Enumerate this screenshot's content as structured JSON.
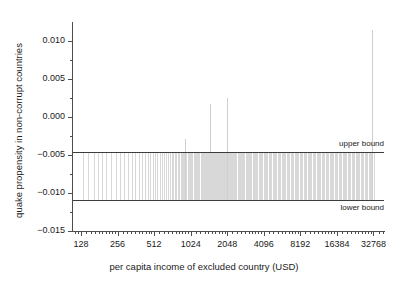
{
  "chart_data": {
    "type": "bar",
    "title": "",
    "xlabel": "per capita income of excluded country (USD)",
    "ylabel": "quake propensity in non-corrupt countries",
    "xscale": "log2",
    "xlim": [
      110,
      40000
    ],
    "ylim": [
      -0.015,
      0.0125
    ],
    "grid": false,
    "legend_position": "none",
    "y_ticks": [
      {
        "value": 0.01,
        "label": "0.010",
        "major": true
      },
      {
        "value": 0.0075,
        "label": "",
        "major": false
      },
      {
        "value": 0.005,
        "label": "0.005",
        "major": true
      },
      {
        "value": 0.0025,
        "label": "",
        "major": false
      },
      {
        "value": 0.0,
        "label": "0.000",
        "major": true
      },
      {
        "value": -0.0025,
        "label": "",
        "major": false
      },
      {
        "value": -0.005,
        "label": "−0.005",
        "major": true
      },
      {
        "value": -0.0075,
        "label": "",
        "major": false
      },
      {
        "value": -0.01,
        "label": "−0.010",
        "major": true
      },
      {
        "value": -0.0125,
        "label": "",
        "major": false
      },
      {
        "value": -0.015,
        "label": "−0.015",
        "major": true
      }
    ],
    "x_ticks": [
      {
        "value": 128,
        "label": "128"
      },
      {
        "value": 256,
        "label": "256"
      },
      {
        "value": 512,
        "label": "512"
      },
      {
        "value": 1024,
        "label": "1024"
      },
      {
        "value": 2048,
        "label": "2048"
      },
      {
        "value": 4096,
        "label": "4096"
      },
      {
        "value": 8192,
        "label": "8192"
      },
      {
        "value": 16384,
        "label": "16384"
      },
      {
        "value": 32768,
        "label": "32768"
      }
    ],
    "reference_lines": [
      {
        "name": "upper bound",
        "label": "upper bound",
        "value": -0.00455,
        "color": "#3c3c3c"
      },
      {
        "name": "lower bound",
        "label": "lower bound",
        "value": -0.0109,
        "color": "#3c3c3c"
      }
    ],
    "series": [
      {
        "name": "quake propensity spikes",
        "color": "#d8d8d8",
        "points": [
          {
            "x": 132,
            "top": -0.00455
          },
          {
            "x": 146,
            "top": -0.00455
          },
          {
            "x": 163,
            "top": -0.00455
          },
          {
            "x": 178,
            "top": -0.00455
          },
          {
            "x": 192,
            "top": -0.00455
          },
          {
            "x": 205,
            "top": -0.00455
          },
          {
            "x": 228,
            "top": -0.00455
          },
          {
            "x": 249,
            "top": -0.00455
          },
          {
            "x": 268,
            "top": -0.00455
          },
          {
            "x": 290,
            "top": -0.00455
          },
          {
            "x": 312,
            "top": -0.00455
          },
          {
            "x": 334,
            "top": -0.00455
          },
          {
            "x": 358,
            "top": -0.00455
          },
          {
            "x": 382,
            "top": -0.00455
          },
          {
            "x": 404,
            "top": -0.00455
          },
          {
            "x": 428,
            "top": -0.00455
          },
          {
            "x": 455,
            "top": -0.00455
          },
          {
            "x": 478,
            "top": -0.00455
          },
          {
            "x": 500,
            "top": -0.00455
          },
          {
            "x": 520,
            "top": -0.00455
          },
          {
            "x": 545,
            "top": -0.00455
          },
          {
            "x": 570,
            "top": -0.00455
          },
          {
            "x": 596,
            "top": -0.00455
          },
          {
            "x": 618,
            "top": -0.00455
          },
          {
            "x": 640,
            "top": -0.00455
          },
          {
            "x": 665,
            "top": -0.00455
          },
          {
            "x": 690,
            "top": -0.00455
          },
          {
            "x": 712,
            "top": -0.00455
          },
          {
            "x": 735,
            "top": -0.00455
          },
          {
            "x": 760,
            "top": -0.00455
          },
          {
            "x": 782,
            "top": -0.00455
          },
          {
            "x": 800,
            "top": -0.00455
          },
          {
            "x": 820,
            "top": -0.00455
          },
          {
            "x": 845,
            "top": -0.00455
          },
          {
            "x": 868,
            "top": -0.00455
          },
          {
            "x": 890,
            "top": -0.00455
          },
          {
            "x": 905,
            "top": -0.00455
          },
          {
            "x": 925,
            "top": -0.0029
          },
          {
            "x": 945,
            "top": -0.00455
          },
          {
            "x": 968,
            "top": -0.00455
          },
          {
            "x": 990,
            "top": -0.00455
          },
          {
            "x": 1010,
            "top": -0.00455
          },
          {
            "x": 1035,
            "top": -0.00455
          },
          {
            "x": 1060,
            "top": -0.00455
          },
          {
            "x": 1085,
            "top": -0.00455
          },
          {
            "x": 1110,
            "top": -0.00455
          },
          {
            "x": 1135,
            "top": -0.00455
          },
          {
            "x": 1160,
            "top": -0.00455
          },
          {
            "x": 1185,
            "top": -0.00455
          },
          {
            "x": 1210,
            "top": -0.00455
          },
          {
            "x": 1235,
            "top": -0.00455
          },
          {
            "x": 1260,
            "top": -0.00455
          },
          {
            "x": 1285,
            "top": -0.00455
          },
          {
            "x": 1310,
            "top": -0.00455
          },
          {
            "x": 1335,
            "top": -0.00455
          },
          {
            "x": 1360,
            "top": -0.00455
          },
          {
            "x": 1390,
            "top": -0.00455
          },
          {
            "x": 1415,
            "top": -0.00455
          },
          {
            "x": 1440,
            "top": -0.00455
          },
          {
            "x": 1465,
            "top": 0.00175
          },
          {
            "x": 1478,
            "top": -0.00455
          },
          {
            "x": 1495,
            "top": -0.00455
          },
          {
            "x": 1515,
            "top": -0.00455
          },
          {
            "x": 1540,
            "top": -0.00455
          },
          {
            "x": 1565,
            "top": -0.00455
          },
          {
            "x": 1590,
            "top": -0.00455
          },
          {
            "x": 1615,
            "top": -0.00455
          },
          {
            "x": 1640,
            "top": -0.00455
          },
          {
            "x": 1665,
            "top": -0.00455
          },
          {
            "x": 1690,
            "top": -0.00455
          },
          {
            "x": 1715,
            "top": -0.00455
          },
          {
            "x": 1740,
            "top": -0.00455
          },
          {
            "x": 1765,
            "top": -0.00455
          },
          {
            "x": 1790,
            "top": -0.00455
          },
          {
            "x": 1815,
            "top": -0.00455
          },
          {
            "x": 1840,
            "top": -0.00455
          },
          {
            "x": 1865,
            "top": -0.00455
          },
          {
            "x": 1890,
            "top": -0.00455
          },
          {
            "x": 1915,
            "top": -0.00455
          },
          {
            "x": 1940,
            "top": -0.00455
          },
          {
            "x": 1965,
            "top": -0.00455
          },
          {
            "x": 1990,
            "top": -0.00455
          },
          {
            "x": 2020,
            "top": -0.00455
          },
          {
            "x": 2050,
            "top": 0.0025
          },
          {
            "x": 2080,
            "top": -0.00455
          },
          {
            "x": 2110,
            "top": -0.00455
          },
          {
            "x": 2150,
            "top": -0.00455
          },
          {
            "x": 2190,
            "top": -0.00455
          },
          {
            "x": 2240,
            "top": -0.00455
          },
          {
            "x": 2290,
            "top": -0.00455
          },
          {
            "x": 2340,
            "top": -0.00455
          },
          {
            "x": 2390,
            "top": -0.00455
          },
          {
            "x": 2440,
            "top": -0.00455
          },
          {
            "x": 2490,
            "top": -0.00455
          },
          {
            "x": 2545,
            "top": -0.00455
          },
          {
            "x": 2600,
            "top": -0.00455
          },
          {
            "x": 2660,
            "top": -0.00455
          },
          {
            "x": 2720,
            "top": -0.00455
          },
          {
            "x": 2780,
            "top": -0.00455
          },
          {
            "x": 2840,
            "top": -0.00455
          },
          {
            "x": 2900,
            "top": -0.00455
          },
          {
            "x": 2960,
            "top": -0.00455
          },
          {
            "x": 3030,
            "top": -0.00455
          },
          {
            "x": 3100,
            "top": -0.00455
          },
          {
            "x": 3170,
            "top": -0.00455
          },
          {
            "x": 3240,
            "top": -0.00455
          },
          {
            "x": 3310,
            "top": -0.00455
          },
          {
            "x": 3390,
            "top": -0.00455
          },
          {
            "x": 3470,
            "top": -0.00455
          },
          {
            "x": 3550,
            "top": -0.00455
          },
          {
            "x": 3630,
            "top": -0.00455
          },
          {
            "x": 3720,
            "top": -0.00455
          },
          {
            "x": 3810,
            "top": -0.00455
          },
          {
            "x": 3900,
            "top": -0.00455
          },
          {
            "x": 3990,
            "top": -0.00455
          },
          {
            "x": 4090,
            "top": -0.00455
          },
          {
            "x": 4190,
            "top": -0.00455
          },
          {
            "x": 4290,
            "top": -0.00455
          },
          {
            "x": 4390,
            "top": -0.00455
          },
          {
            "x": 4500,
            "top": -0.00455
          },
          {
            "x": 4610,
            "top": -0.00455
          },
          {
            "x": 4720,
            "top": -0.00455
          },
          {
            "x": 4840,
            "top": -0.00455
          },
          {
            "x": 4960,
            "top": -0.00455
          },
          {
            "x": 5080,
            "top": -0.00455
          },
          {
            "x": 5210,
            "top": -0.00455
          },
          {
            "x": 5340,
            "top": -0.00455
          },
          {
            "x": 5470,
            "top": -0.00455
          },
          {
            "x": 5600,
            "top": -0.00455
          },
          {
            "x": 5740,
            "top": -0.00455
          },
          {
            "x": 5880,
            "top": -0.00455
          },
          {
            "x": 6030,
            "top": -0.00455
          },
          {
            "x": 6180,
            "top": -0.00455
          },
          {
            "x": 6330,
            "top": -0.00455
          },
          {
            "x": 6490,
            "top": -0.00455
          },
          {
            "x": 6650,
            "top": -0.00455
          },
          {
            "x": 6820,
            "top": -0.00455
          },
          {
            "x": 6990,
            "top": -0.00455
          },
          {
            "x": 7160,
            "top": -0.00455
          },
          {
            "x": 7340,
            "top": -0.00455
          },
          {
            "x": 7520,
            "top": -0.00455
          },
          {
            "x": 7710,
            "top": -0.00455
          },
          {
            "x": 7900,
            "top": -0.00455
          },
          {
            "x": 8100,
            "top": -0.00455
          },
          {
            "x": 8300,
            "top": -0.00455
          },
          {
            "x": 8510,
            "top": -0.00455
          },
          {
            "x": 8720,
            "top": -0.00455
          },
          {
            "x": 8940,
            "top": -0.00455
          },
          {
            "x": 9160,
            "top": -0.00455
          },
          {
            "x": 9390,
            "top": -0.00455
          },
          {
            "x": 9620,
            "top": -0.00455
          },
          {
            "x": 9860,
            "top": -0.00455
          },
          {
            "x": 10100,
            "top": -0.00455
          },
          {
            "x": 10350,
            "top": -0.00455
          },
          {
            "x": 10600,
            "top": -0.00455
          },
          {
            "x": 10870,
            "top": -0.00455
          },
          {
            "x": 11140,
            "top": -0.00455
          },
          {
            "x": 11420,
            "top": -0.00455
          },
          {
            "x": 11700,
            "top": -0.00455
          },
          {
            "x": 11990,
            "top": -0.00455
          },
          {
            "x": 12290,
            "top": -0.00455
          },
          {
            "x": 12600,
            "top": -0.00455
          },
          {
            "x": 12910,
            "top": -0.00455
          },
          {
            "x": 13230,
            "top": -0.00455
          },
          {
            "x": 13560,
            "top": -0.00455
          },
          {
            "x": 13900,
            "top": -0.00455
          },
          {
            "x": 14250,
            "top": -0.00455
          },
          {
            "x": 14600,
            "top": -0.00455
          },
          {
            "x": 14970,
            "top": -0.00455
          },
          {
            "x": 15340,
            "top": -0.00455
          },
          {
            "x": 15720,
            "top": -0.00455
          },
          {
            "x": 16110,
            "top": -0.00455
          },
          {
            "x": 16520,
            "top": -0.00455
          },
          {
            "x": 16930,
            "top": -0.00455
          },
          {
            "x": 17350,
            "top": -0.00455
          },
          {
            "x": 17780,
            "top": -0.00455
          },
          {
            "x": 18230,
            "top": -0.00455
          },
          {
            "x": 18680,
            "top": -0.00455
          },
          {
            "x": 19150,
            "top": -0.00455
          },
          {
            "x": 19630,
            "top": -0.00455
          },
          {
            "x": 20120,
            "top": -0.00455
          },
          {
            "x": 20620,
            "top": -0.00455
          },
          {
            "x": 21140,
            "top": -0.00455
          },
          {
            "x": 21660,
            "top": -0.00455
          },
          {
            "x": 22200,
            "top": -0.00455
          },
          {
            "x": 22760,
            "top": -0.00455
          },
          {
            "x": 23330,
            "top": -0.00455
          },
          {
            "x": 23910,
            "top": -0.00455
          },
          {
            "x": 24510,
            "top": -0.00455
          },
          {
            "x": 25120,
            "top": -0.00455
          },
          {
            "x": 25750,
            "top": -0.00455
          },
          {
            "x": 26390,
            "top": -0.00455
          },
          {
            "x": 27050,
            "top": -0.00455
          },
          {
            "x": 27730,
            "top": -0.00455
          },
          {
            "x": 28420,
            "top": -0.00455
          },
          {
            "x": 29130,
            "top": -0.00455
          },
          {
            "x": 29860,
            "top": -0.00455
          },
          {
            "x": 30610,
            "top": -0.00455
          },
          {
            "x": 31370,
            "top": -0.00455
          },
          {
            "x": 32160,
            "top": 0.0115
          },
          {
            "x": 32900,
            "top": -0.00455
          }
        ]
      }
    ]
  }
}
